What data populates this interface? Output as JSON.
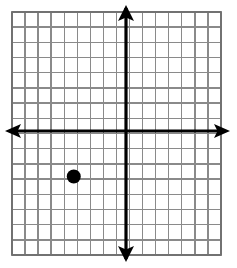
{
  "figure": {
    "title": "Coordinate grid with one plotted point",
    "width": 237,
    "height": 268,
    "background_color": "#ffffff"
  },
  "chart_data": {
    "type": "scatter",
    "title": "",
    "subtitle": "",
    "xlabel": "",
    "ylabel": "",
    "xlim": [
      -8,
      8
    ],
    "ylim": [
      -8,
      8
    ],
    "xticks": [
      -8,
      -7,
      -6,
      -5,
      -4,
      -3,
      -2,
      -1,
      0,
      1,
      2,
      3,
      4,
      5,
      6,
      7,
      8
    ],
    "yticks": [
      -8,
      -7,
      -6,
      -5,
      -4,
      -3,
      -2,
      -1,
      0,
      1,
      2,
      3,
      4,
      5,
      6,
      7,
      8
    ],
    "xtick_labels": [],
    "ytick_labels": [],
    "grid": true,
    "grid_columns": 16,
    "grid_rows": 16,
    "grid_color": "#8a8a8a",
    "grid_line_width": 1.4,
    "axis_color": "#000000",
    "axis_line_width": 3.2,
    "axis_arrows": [
      "up",
      "down",
      "left",
      "right"
    ],
    "legend": false,
    "legend_position": "none",
    "series": [
      {
        "name": "plotted-point",
        "marker": "filled-circle",
        "color": "#000000",
        "marker_radius": 7,
        "points": [
          {
            "x": -4,
            "y": -3
          }
        ]
      }
    ],
    "annotations": []
  },
  "plot_geometry": {
    "grid_left": 12,
    "grid_right": 221,
    "grid_top": 12,
    "grid_bottom": 255,
    "origin_x": 126,
    "origin_y": 131,
    "cell_width": 13.06,
    "cell_height": 15.19,
    "point_pixel_x": 77,
    "point_pixel_y": 172,
    "arrow_up_tip_y": 5,
    "arrow_down_tip_y": 262,
    "arrow_left_tip_x": 5,
    "arrow_right_tip_x": 230
  },
  "icons": {
    "point_marker": "filled-circle-marker",
    "arrow_up": "arrow-up-icon",
    "arrow_down": "arrow-down-icon",
    "arrow_left": "arrow-left-icon",
    "arrow_right": "arrow-right-icon"
  }
}
